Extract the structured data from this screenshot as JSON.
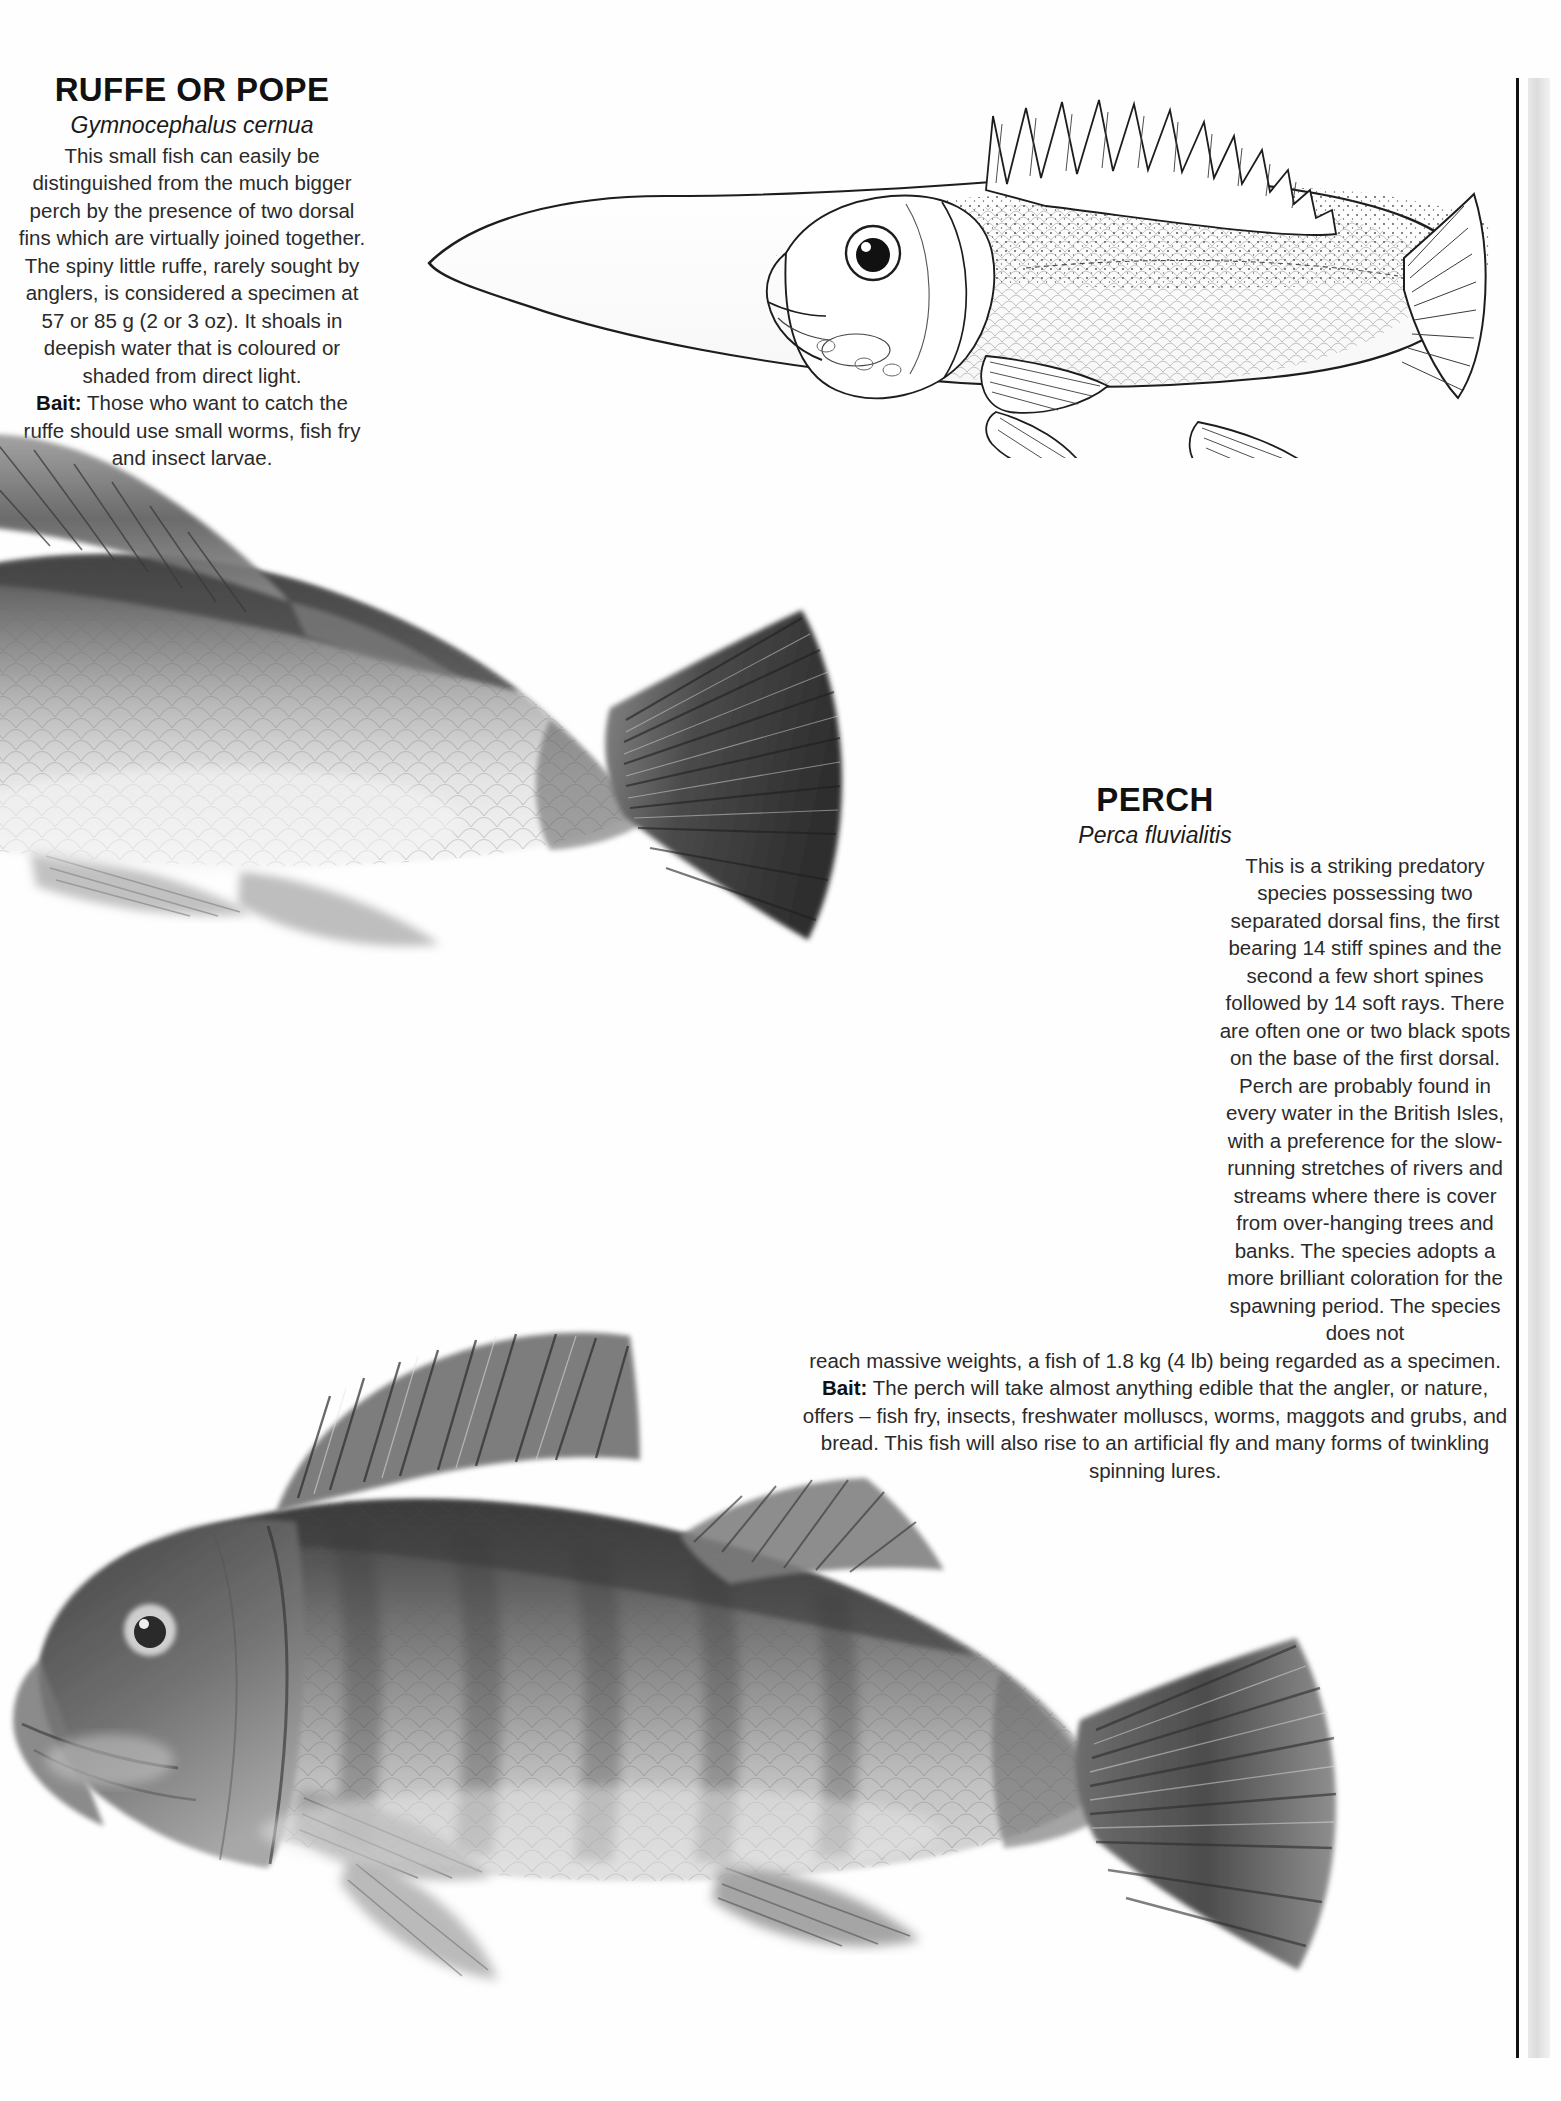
{
  "page": {
    "background_color": "#ffffff",
    "text_color": "#2a2a2a",
    "gutter_rule_color": "#111111"
  },
  "entries": [
    {
      "id": "ruffe",
      "title": "RUFFE OR POPE",
      "latin_name": "Gymnocephalus cernua",
      "description": "This small fish can easily be distinguished from the much bigger perch by the presence of two dorsal fins which are virtually joined together. The spiny little ruffe, rarely sought by anglers, is considered a specimen at 57 or 85 g (2 or 3 oz). It shoals in deepish water that is coloured or shaded from direct light.",
      "bait_label": "Bait:",
      "bait_text": " Those who want to catch the ruffe should use small worms, fish fry and insect larvae."
    },
    {
      "id": "perch",
      "title": "PERCH",
      "latin_name": "Perca fluvialitis",
      "description_narrow": "This is a striking predatory species possessing two separated dorsal fins, the first bearing 14 stiff spines and the second a few short spines followed by 14 soft rays. There are often one or two black spots on the base of the first dorsal. Perch are probably found in every water in the British Isles, with a preference for the slow-running stretches of rivers and streams where there is cover from over-hanging trees and banks. The species adopts a more brilliant coloration for the spawning period. The species does not",
      "description_wide": "reach massive weights, a fish of 1.8 kg (4 lb) being regarded as a specimen.",
      "bait_label": "Bait:",
      "bait_text": " The perch will take almost anything edible that the angler, or nature, offers – fish fry, insects, freshwater molluscs, worms, maggots and grubs, and bread. This fish will also rise to an artificial fly and many forms of twinkling spinning lures."
    }
  ],
  "illustrations": [
    {
      "id": "ruffe-illustration",
      "subject": "ruffe-fish-line-drawing",
      "style": "pen-and-ink line art",
      "facing": "left"
    },
    {
      "id": "perch-top-illustration",
      "subject": "perch-fish-photograph-partial",
      "style": "greyscale photograph, rear half of fish with tail",
      "facing": "left"
    },
    {
      "id": "perch-bottom-illustration",
      "subject": "perch-fish-photograph-full",
      "style": "greyscale photograph, whole fish",
      "facing": "left"
    }
  ]
}
